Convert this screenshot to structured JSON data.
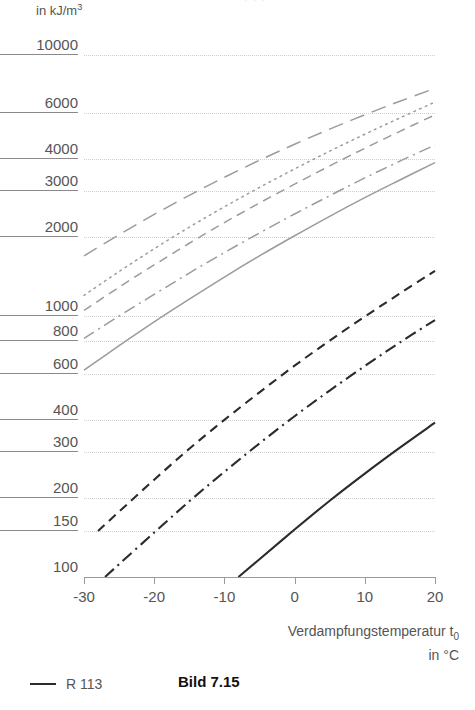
{
  "figure": {
    "caption": "Bild 7.15",
    "clipped_top_text": "· · ·"
  },
  "axes": {
    "y_unit_label": "in kJ/m",
    "y_unit_exponent": "3",
    "y_scale": "log",
    "y_ticks": [
      "10000",
      "6000",
      "4000",
      "3000",
      "2000",
      "1000",
      "800",
      "600",
      "400",
      "300",
      "200",
      "150",
      "100"
    ],
    "x_title_line1": "Verdampfungstemperatur t",
    "x_title_sub": "0",
    "x_title_line2": "in °C",
    "x_scale": "linear",
    "x_ticks": [
      "-30",
      "-20",
      "-10",
      "0",
      "10",
      "20"
    ]
  },
  "legend": {
    "items": [
      {
        "style": "solid",
        "color": "#2b2b2b",
        "label": "R 113"
      }
    ]
  },
  "colors": {
    "grid": "#cfcfcf",
    "axis": "#9a9a9a",
    "text": "#555555",
    "curve_gray": "#9b9b9b",
    "curve_black": "#2b2b2b"
  },
  "chart_data": {
    "type": "line",
    "title": "",
    "xlabel": "Verdampfungstemperatur t0 in °C",
    "ylabel": "in kJ/m³",
    "xlim": [
      -30,
      20
    ],
    "ylim": [
      100,
      10000
    ],
    "yscale": "log",
    "xscale": "linear",
    "grid": true,
    "legend_position": "below-plot",
    "x_ticks": [
      -30,
      -20,
      -10,
      0,
      10,
      20
    ],
    "y_ticks": [
      100,
      150,
      200,
      300,
      400,
      600,
      800,
      1000,
      2000,
      3000,
      4000,
      6000,
      10000
    ],
    "series": [
      {
        "name": "curve-gray-longdash",
        "style": "long-dash",
        "color": "#9b9b9b",
        "x": [
          -30,
          -25,
          -20,
          -15,
          -10,
          -5,
          0,
          5,
          10,
          15,
          20
        ],
        "values": [
          1700,
          2050,
          2450,
          2900,
          3400,
          3950,
          4550,
          5200,
          5900,
          6650,
          7450
        ]
      },
      {
        "name": "curve-gray-dotted",
        "style": "dotted",
        "color": "#9b9b9b",
        "x": [
          -30,
          -25,
          -20,
          -15,
          -10,
          -5,
          0,
          5,
          10,
          15,
          20
        ],
        "values": [
          1200,
          1480,
          1810,
          2190,
          2620,
          3110,
          3660,
          4280,
          4970,
          5740,
          6600
        ]
      },
      {
        "name": "curve-gray-dashed",
        "style": "dashed",
        "color": "#9b9b9b",
        "x": [
          -30,
          -25,
          -20,
          -15,
          -10,
          -5,
          0,
          5,
          10,
          15,
          20
        ],
        "values": [
          1050,
          1290,
          1570,
          1900,
          2280,
          2710,
          3200,
          3760,
          4390,
          5100,
          5900
        ]
      },
      {
        "name": "curve-gray-dashdot",
        "style": "dash-dot",
        "color": "#9b9b9b",
        "x": [
          -30,
          -25,
          -20,
          -15,
          -10,
          -5,
          0,
          5,
          10,
          15,
          20
        ],
        "values": [
          820,
          1000,
          1210,
          1460,
          1750,
          2080,
          2460,
          2890,
          3380,
          3920,
          4520
        ]
      },
      {
        "name": "curve-gray-solid",
        "style": "solid",
        "color": "#9b9b9b",
        "x": [
          -30,
          -25,
          -20,
          -15,
          -10,
          -5,
          0,
          5,
          10,
          15,
          20
        ],
        "values": [
          620,
          770,
          950,
          1160,
          1410,
          1700,
          2030,
          2410,
          2840,
          3320,
          3870
        ]
      },
      {
        "name": "curve-black-dashed",
        "style": "dashed",
        "color": "#2b2b2b",
        "x": [
          -28,
          -25,
          -20,
          -15,
          -10,
          -5,
          0,
          5,
          10,
          15,
          20
        ],
        "values": [
          150,
          178,
          236,
          310,
          400,
          510,
          645,
          805,
          995,
          1220,
          1490
        ]
      },
      {
        "name": "curve-black-dashdot",
        "style": "dash-dot",
        "color": "#2b2b2b",
        "x": [
          -27,
          -25,
          -20,
          -15,
          -10,
          -5,
          0,
          5,
          10,
          15,
          20
        ],
        "values": [
          100,
          112,
          148,
          195,
          253,
          325,
          413,
          518,
          643,
          792,
          965
        ]
      },
      {
        "name": "curve-black-solid",
        "style": "solid",
        "color": "#2b2b2b",
        "x": [
          -8,
          -5,
          0,
          5,
          10,
          15,
          20
        ],
        "values": [
          100,
          117,
          152,
          196,
          249,
          313,
          390
        ]
      }
    ]
  }
}
